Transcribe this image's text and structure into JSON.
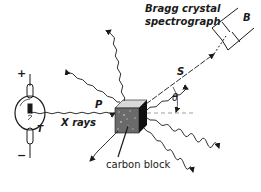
{
  "diagram": {
    "type": "compton-scattering-apparatus",
    "colors": {
      "ink": "#1a1a1a",
      "background": "#ffffff",
      "dashed_axis": "#888888"
    },
    "labels": {
      "spectrograph": [
        "Bragg crystal",
        "spectrograph"
      ],
      "spectrograph_letter": "B",
      "scattered_ray": "S",
      "angle": "θ",
      "primary_ray": "P",
      "xrays": "X rays",
      "tube_letter": "T",
      "plus": "+",
      "minus": "−",
      "block": "carbon block"
    },
    "components": [
      {
        "name": "x-ray tube",
        "label": "T"
      },
      {
        "name": "primary beam",
        "label": "P"
      },
      {
        "name": "carbon block scatterer"
      },
      {
        "name": "scattered beam",
        "label": "S"
      },
      {
        "name": "scattering angle",
        "label": "θ"
      },
      {
        "name": "Bragg crystal spectrograph",
        "label": "B"
      }
    ]
  }
}
